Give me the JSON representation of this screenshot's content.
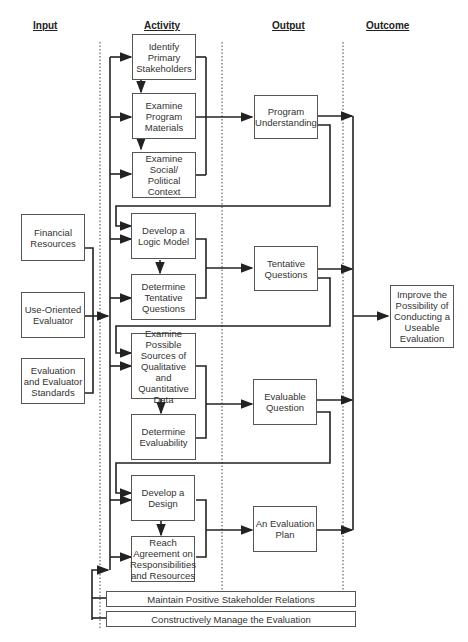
{
  "headers": {
    "input": "Input",
    "activity": "Activity",
    "output": "Output",
    "outcome": "Outcome"
  },
  "inputs": [
    {
      "label": "Financial Resources"
    },
    {
      "label": "Use-Oriented Evaluator"
    },
    {
      "label": "Evaluation and Evaluator Standards"
    }
  ],
  "activities": [
    {
      "label": "Identify Primary Stakeholders"
    },
    {
      "label": "Examine Program Materials"
    },
    {
      "label": "Examine Social/ Political Context"
    },
    {
      "label": "Develop a Logic Model"
    },
    {
      "label": "Determine Tentative Questions"
    },
    {
      "label": "Examine Possible Sources of Qualitative and Quantitative Data"
    },
    {
      "label": "Determine Evaluability"
    },
    {
      "label": "Develop a Design"
    },
    {
      "label": "Reach Agreement on Responsibilities and Resources"
    }
  ],
  "outputs": [
    {
      "label": "Program Understanding"
    },
    {
      "label": "Tentative Questions"
    },
    {
      "label": "Evaluable Question"
    },
    {
      "label": "An Evaluation Plan"
    }
  ],
  "outcome": {
    "label": "Improve the Possibility of Conducting a Useable Evaluation"
  },
  "bars": [
    {
      "label": "Maintain Positive Stakeholder Relations"
    },
    {
      "label": "Constructively Manage the Evaluation"
    }
  ],
  "colors": {
    "line": "#222222",
    "box_border": "#555555",
    "background": "#ffffff"
  }
}
